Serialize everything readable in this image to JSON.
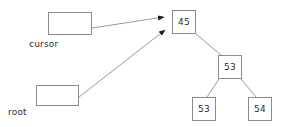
{
  "diagram": {
    "type": "binary-search-tree-with-pointers",
    "background_color": "#ffffff",
    "node_border_color": "#8c8c8c",
    "edge_color": "#9a9a9a",
    "arrow_color": "#1a1a1a",
    "text_color": "#2b2b2b",
    "pointers": [
      {
        "id": "cursor",
        "label": "cursor",
        "box": {
          "x": 48,
          "y": 12,
          "width": 44,
          "height": 23
        },
        "label_position": {
          "x": 29,
          "y": 39
        },
        "points_to": "node-45",
        "arrow": {
          "from_x": 92,
          "from_y": 28,
          "to_x": 171,
          "to_y": 17
        }
      },
      {
        "id": "root",
        "label": "root",
        "box": {
          "x": 36,
          "y": 85,
          "width": 43,
          "height": 21
        },
        "label_position": {
          "x": 8,
          "y": 107
        },
        "points_to": "node-45",
        "arrow": {
          "from_x": 74,
          "from_y": 101,
          "to_x": 171,
          "to_y": 29
        }
      }
    ],
    "nodes": [
      {
        "id": "node-45",
        "value": "45",
        "x": 172,
        "y": 10,
        "width": 24,
        "height": 24,
        "role": "root"
      },
      {
        "id": "node-53-mid",
        "value": "53",
        "x": 218,
        "y": 55,
        "width": 24,
        "height": 24,
        "role": "right-child-of-45"
      },
      {
        "id": "node-53-left",
        "value": "53",
        "x": 192,
        "y": 97,
        "width": 24,
        "height": 24,
        "role": "left-child-of-53"
      },
      {
        "id": "node-54",
        "value": "54",
        "x": 248,
        "y": 97,
        "width": 24,
        "height": 24,
        "role": "right-child-of-53"
      }
    ],
    "edges": [
      {
        "from": "node-45",
        "to": "node-53-mid",
        "x1": 196,
        "y1": 34,
        "x2": 221,
        "y2": 55
      },
      {
        "from": "node-53-mid",
        "to": "node-53-left",
        "x1": 219,
        "y1": 79,
        "x2": 207,
        "y2": 97
      },
      {
        "from": "node-53-mid",
        "to": "node-54",
        "x1": 241,
        "y1": 79,
        "x2": 256,
        "y2": 97
      }
    ]
  }
}
